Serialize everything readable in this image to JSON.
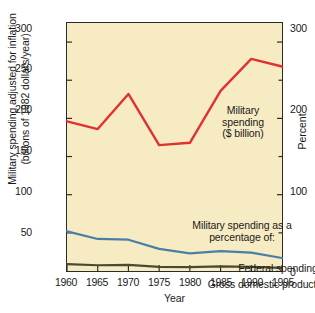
{
  "chart_data": {
    "type": "line",
    "title": "",
    "xlabel": "Year",
    "ylabel": "Military spending adjusted for inflation (billions of 1982 dollars/year)",
    "ylabel_left_line1": "Military spending adjusted for inflation",
    "ylabel_left_line2": "(billions of 1982 dollars/year)",
    "ylabel_right": "Percent",
    "x": [
      1960,
      1965,
      1970,
      1975,
      1980,
      1985,
      1990,
      1995
    ],
    "xtick_labels": [
      "1960",
      "1965",
      "1970",
      "1975",
      "1980",
      "1985",
      "1990",
      "1995"
    ],
    "xlim": [
      1960,
      1995
    ],
    "ylim_left": [
      0,
      325
    ],
    "ytick_left_labels": [
      "300",
      "250",
      "200",
      "150",
      "100",
      "50"
    ],
    "ytick_left_values": [
      300,
      250,
      200,
      150,
      100,
      50
    ],
    "ylim_right": [
      0,
      325
    ],
    "ytick_right_labels": [
      "300",
      "200",
      "100",
      "0"
    ],
    "ytick_right_values": [
      300,
      200,
      100,
      0
    ],
    "grid": false,
    "legend_position": "inline-annotations",
    "series": [
      {
        "name": "Military spending ($ billion)",
        "axis": "left",
        "color": "#e03131",
        "values": [
          196,
          186,
          232,
          165,
          168,
          236,
          278,
          268
        ]
      },
      {
        "name": "Federal spending",
        "axis": "right",
        "color": "#4a7fa5",
        "values": [
          52,
          42,
          41,
          29,
          23,
          26,
          24,
          17
        ]
      },
      {
        "name": "Gross domestic product",
        "axis": "right",
        "color": "#4a4a2e",
        "values": [
          9,
          7.5,
          8,
          5.5,
          5,
          6,
          5.5,
          4
        ]
      }
    ],
    "annotations": [
      {
        "id": "military",
        "line1": "Military",
        "line2": "spending",
        "line3": "($ billion)"
      },
      {
        "id": "percentage-of",
        "line1": "Military spending as a",
        "line2": "percentage of:"
      },
      {
        "id": "federal-spending",
        "text": "Federal spending"
      },
      {
        "id": "gdp",
        "text": "Gross domestic product"
      }
    ],
    "colors": {
      "plot_background": "#f7ebc4",
      "axis": "#2b2b2b",
      "military_line": "#e03131",
      "federal_line": "#4a7fa5",
      "gdp_line": "#4a4a2e",
      "page_background": "#ffffff"
    }
  }
}
